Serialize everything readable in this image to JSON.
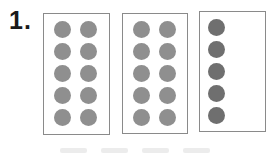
{
  "problem": {
    "number_label": "1.",
    "frames": [
      {
        "name": "frame-1",
        "dots": 10,
        "columns": 2,
        "rows": 5,
        "dot_color": "#8f8f8f"
      },
      {
        "name": "frame-2",
        "dots": 10,
        "columns": 2,
        "rows": 5,
        "dot_color": "#8f8f8f"
      },
      {
        "name": "frame-3",
        "dots": 5,
        "columns": 1,
        "rows": 5,
        "dot_color": "#6f6f6f"
      }
    ],
    "total_dots": 25
  },
  "colors": {
    "frame_border": "#8a8a8a",
    "dot_light": "#8f8f8f",
    "dot_dark": "#6f6f6f",
    "text": "#1a1a1a"
  }
}
